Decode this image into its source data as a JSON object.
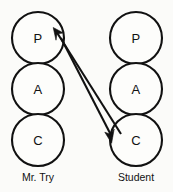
{
  "diagram": {
    "type": "transactional-analysis-pac",
    "background_color": "#fbfbf9",
    "stroke_color": "#111111",
    "fill_color": "#fdfdfb",
    "columns": [
      {
        "id": "left",
        "label": "Mr. Try",
        "center_x": 38,
        "label_y": 177,
        "circles": [
          {
            "id": "left-parent",
            "letter": "P",
            "cx": 38,
            "cy": 38,
            "r": 26,
            "name": "Parent"
          },
          {
            "id": "left-adult",
            "letter": "A",
            "cx": 38,
            "cy": 89,
            "r": 26,
            "name": "Adult"
          },
          {
            "id": "left-child",
            "letter": "C",
            "cx": 38,
            "cy": 140,
            "r": 26,
            "name": "Child"
          }
        ]
      },
      {
        "id": "right",
        "label": "Student",
        "center_x": 136,
        "label_y": 177,
        "circles": [
          {
            "id": "right-parent",
            "letter": "P",
            "cx": 136,
            "cy": 38,
            "r": 26,
            "name": "Parent"
          },
          {
            "id": "right-adult",
            "letter": "A",
            "cx": 136,
            "cy": 89,
            "r": 26,
            "name": "Adult"
          },
          {
            "id": "right-child",
            "letter": "C",
            "cx": 136,
            "cy": 140,
            "r": 26,
            "name": "Child"
          }
        ]
      }
    ],
    "transactions": [
      {
        "id": "stimulus",
        "from": "right-child",
        "to": "left-parent",
        "direction": "up-left",
        "arrow_tip": [
          54,
          29
        ],
        "arrow_tail": [
          120,
          133
        ]
      },
      {
        "id": "response",
        "from": "left-parent",
        "to": "right-child",
        "direction": "down-right",
        "arrow_tip": [
          110,
          140
        ],
        "arrow_tail": [
          60,
          36
        ]
      }
    ]
  }
}
